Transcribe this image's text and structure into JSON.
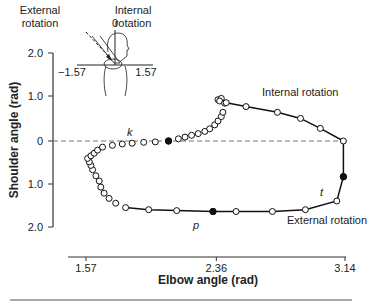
{
  "chart_data": {
    "type": "scatter",
    "title": "",
    "xlabel": "Elbow angle (rad)",
    "ylabel": "Shoulder angle (rad)",
    "x_ticks": [
      "1.57",
      "2.36",
      "3.14"
    ],
    "y_ticks": [
      "2.0",
      "1.0",
      "0",
      "1.0",
      "2.0"
    ],
    "xlim": [
      1.49,
      3.14
    ],
    "ylim": [
      -2.0,
      2.0
    ],
    "grid": false,
    "reference_line": {
      "y": 0,
      "style": "dashed"
    },
    "annotations": [
      {
        "label": "Internal rotation",
        "region": "upper-right"
      },
      {
        "label": "External rotation",
        "region": "lower-right"
      },
      {
        "label": "k",
        "point": [
          2.07,
          0.0
        ],
        "filled": true
      },
      {
        "label": "t",
        "point": [
          3.13,
          -0.82
        ],
        "filled": true
      },
      {
        "label": "p",
        "point": [
          2.34,
          -1.62
        ],
        "filled": true
      }
    ],
    "series": [
      {
        "name": "trajectory",
        "marker": "open-circle",
        "x": [
          2.37,
          2.39,
          2.38,
          2.41,
          2.42,
          2.54,
          2.73,
          2.87,
          2.99,
          3.13,
          3.13,
          3.09,
          2.9,
          2.7,
          2.48,
          2.34,
          2.12,
          1.95,
          1.81,
          1.75,
          1.71,
          1.68,
          1.66,
          1.65,
          1.63,
          1.61,
          1.6,
          1.59,
          1.58,
          1.6,
          1.62,
          1.64,
          1.67,
          1.73,
          1.79,
          1.85,
          1.92,
          1.99,
          2.07,
          2.13,
          2.17,
          2.21,
          2.25,
          2.29,
          2.32,
          2.35,
          2.37,
          2.39,
          2.4
        ],
        "y": [
          0.95,
          0.98,
          0.92,
          0.87,
          0.88,
          0.79,
          0.66,
          0.52,
          0.29,
          0.0,
          -0.82,
          -1.38,
          -1.58,
          -1.62,
          -1.62,
          -1.62,
          -1.6,
          -1.58,
          -1.53,
          -1.43,
          -1.32,
          -1.2,
          -1.06,
          -0.92,
          -0.8,
          -0.66,
          -0.56,
          -0.48,
          -0.4,
          -0.34,
          -0.28,
          -0.21,
          -0.14,
          -0.1,
          -0.07,
          -0.05,
          -0.03,
          -0.02,
          0.0,
          0.05,
          0.09,
          0.13,
          0.17,
          0.22,
          0.28,
          0.37,
          0.46,
          0.56,
          0.66
        ]
      }
    ],
    "inset": {
      "labels": [
        "External rotation",
        "Internal rotation",
        "0",
        "-1.57",
        "1.57"
      ],
      "description": "Top-down view of shoulder with arm and rotation angle scale"
    }
  },
  "labels": {
    "inset_external": [
      "External",
      "rotation"
    ],
    "inset_internal": [
      "Internal",
      "rotation"
    ],
    "inset_zero": "0",
    "inset_left": "−1.57",
    "inset_right": "1.57",
    "internal_rotation": "Internal rotation",
    "external_rotation": "External rotation",
    "k": "k",
    "t": "t",
    "p": "p",
    "xlabel": "Elbow angle (rad)",
    "ylabel": "Shoulder angle (rad)"
  }
}
